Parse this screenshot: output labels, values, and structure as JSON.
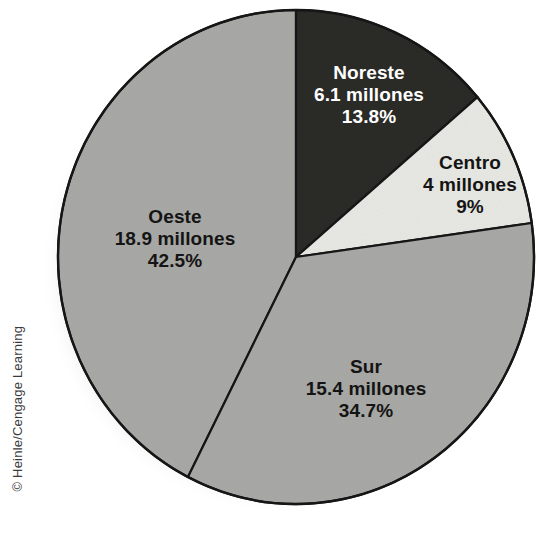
{
  "credit": "© Heinle/Cengage Learning",
  "colors": {
    "background": "#ffffff",
    "slice_dark": "#2a2a28",
    "slice_light": "#e7e7e3",
    "slice_gray": "#a8a8a6",
    "outline": "#161616",
    "shadow": "#9b9b9b",
    "text_on_dark": "#ffffff",
    "text_on_light": "#141414"
  },
  "chart_data": {
    "type": "pie",
    "title": "",
    "unit_label": "millones",
    "legend_position": "inside-slices",
    "start_angle_deg": 0,
    "direction": "clockwise",
    "categories": [
      "Noreste",
      "Centro",
      "Sur",
      "Oeste"
    ],
    "values": [
      6.1,
      4,
      15.4,
      18.9
    ],
    "percents": [
      13.8,
      9,
      34.7,
      42.5
    ],
    "slices": [
      {
        "name": "Noreste",
        "value": 6.1,
        "value_label": "6.1 millones",
        "percent": 13.8,
        "percent_label": "13.8%",
        "color": "#2a2a28",
        "text_color": "#ffffff",
        "start_deg": 0,
        "end_deg": 49.68
      },
      {
        "name": "Centro",
        "value": 4,
        "value_label": "4 millones",
        "percent": 9,
        "percent_label": "9%",
        "color": "#e7e7e3",
        "text_color": "#141414",
        "start_deg": 49.68,
        "end_deg": 82.08
      },
      {
        "name": "Sur",
        "value": 15.4,
        "value_label": "15.4 millones",
        "percent": 34.7,
        "percent_label": "34.7%",
        "color": "#a8a8a6",
        "text_color": "#141414",
        "start_deg": 82.08,
        "end_deg": 207.0
      },
      {
        "name": "Oeste",
        "value": 18.9,
        "value_label": "18.9 millones",
        "percent": 42.5,
        "percent_label": "42.5%",
        "color": "#a8a8a6",
        "text_color": "#141414",
        "start_deg": 207.0,
        "end_deg": 360.0
      }
    ]
  }
}
